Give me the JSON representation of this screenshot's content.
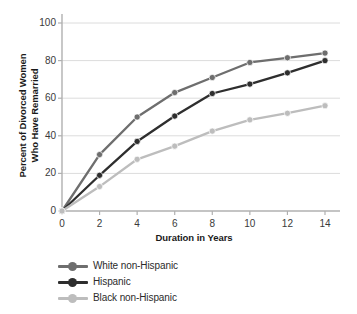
{
  "chart_data": {
    "type": "line",
    "title": "",
    "xlabel": "Duration in Years",
    "ylabel": "Percent of Divorced Women Who Have Remarried",
    "ylabel_line1": "Percent of Divorced Women",
    "ylabel_line2": "Who Have Remarried",
    "x": [
      0,
      2,
      4,
      6,
      8,
      10,
      12,
      14
    ],
    "xtick_labels": [
      "0",
      "2",
      "4",
      "6",
      "8",
      "10",
      "12",
      "14"
    ],
    "ytick_labels": [
      "0",
      "20",
      "40",
      "60",
      "80",
      "100"
    ],
    "yticks": [
      0,
      20,
      40,
      60,
      80,
      100
    ],
    "xlim": [
      0,
      15
    ],
    "ylim": [
      0,
      100
    ],
    "grid": "horizontal",
    "legend_position": "below-plot-left",
    "series": [
      {
        "name": "White non-Hispanic",
        "color": "#6e6e6e",
        "marker": "circle",
        "values": [
          0,
          30,
          50,
          63,
          71,
          79,
          81.5,
          84
        ]
      },
      {
        "name": "Hispanic",
        "color": "#2e2e2e",
        "marker": "circle",
        "values": [
          0,
          19,
          37,
          50.5,
          62.5,
          67.5,
          73.5,
          80
        ]
      },
      {
        "name": "Black non-Hispanic",
        "color": "#bdbdbd",
        "marker": "circle",
        "values": [
          0,
          13,
          27.5,
          34.5,
          42.5,
          48.5,
          52,
          56
        ]
      }
    ],
    "colors": {
      "axis": "#b0b0b0",
      "grid": "#dcdcdc",
      "tick_text": "#3a3a3a",
      "title_text": "#1a1a1a",
      "background": "#ffffff"
    }
  }
}
